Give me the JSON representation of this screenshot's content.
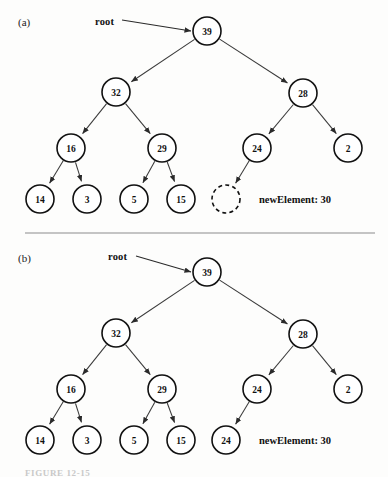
{
  "figure": {
    "caption": "FIGURE 12-15",
    "divider_y": 233
  },
  "panels": [
    {
      "id": "a",
      "label": "(a)",
      "label_pos": {
        "x": 18,
        "y": 16
      },
      "root_pointer": {
        "label": "root",
        "label_pos": {
          "x": 95,
          "y": 16
        },
        "line": {
          "x1": 122,
          "y1": 20,
          "x2": 191,
          "y2": 31
        }
      },
      "new_element": {
        "label": "newElement: 30",
        "pos": {
          "x": 259,
          "y": 194
        }
      },
      "nodes": [
        {
          "name": "node-39",
          "value": "39",
          "cx": 207,
          "cy": 31,
          "r": 14,
          "style": "solid"
        },
        {
          "name": "node-32",
          "value": "32",
          "cx": 116,
          "cy": 92,
          "r": 14,
          "style": "solid"
        },
        {
          "name": "node-28",
          "value": "28",
          "cx": 303,
          "cy": 93,
          "r": 14,
          "style": "solid"
        },
        {
          "name": "node-16",
          "value": "16",
          "cx": 71,
          "cy": 148,
          "r": 14,
          "style": "solid"
        },
        {
          "name": "node-29",
          "value": "29",
          "cx": 162,
          "cy": 148,
          "r": 14,
          "style": "solid"
        },
        {
          "name": "node-24",
          "value": "24",
          "cx": 257,
          "cy": 148,
          "r": 14,
          "style": "solid"
        },
        {
          "name": "node-2",
          "value": "2",
          "cx": 348,
          "cy": 148,
          "r": 14,
          "style": "solid"
        },
        {
          "name": "node-14",
          "value": "14",
          "cx": 40,
          "cy": 199,
          "r": 14,
          "style": "solid"
        },
        {
          "name": "node-3",
          "value": "3",
          "cx": 87,
          "cy": 199,
          "r": 14,
          "style": "solid"
        },
        {
          "name": "node-5",
          "value": "5",
          "cx": 134,
          "cy": 199,
          "r": 14,
          "style": "solid"
        },
        {
          "name": "node-15",
          "value": "15",
          "cx": 181,
          "cy": 199,
          "r": 14,
          "style": "solid"
        },
        {
          "name": "node-empty",
          "value": "",
          "cx": 226,
          "cy": 199,
          "r": 14,
          "style": "dashed"
        }
      ],
      "edges": [
        {
          "from": "node-39",
          "to": "node-32"
        },
        {
          "from": "node-39",
          "to": "node-28"
        },
        {
          "from": "node-32",
          "to": "node-16"
        },
        {
          "from": "node-32",
          "to": "node-29"
        },
        {
          "from": "node-28",
          "to": "node-24"
        },
        {
          "from": "node-28",
          "to": "node-2"
        },
        {
          "from": "node-16",
          "to": "node-14"
        },
        {
          "from": "node-16",
          "to": "node-3"
        },
        {
          "from": "node-29",
          "to": "node-5"
        },
        {
          "from": "node-29",
          "to": "node-15"
        },
        {
          "from": "node-24",
          "to": "node-empty"
        }
      ]
    },
    {
      "id": "b",
      "label": "(b)",
      "label_pos": {
        "x": 18,
        "y": 252
      },
      "root_pointer": {
        "label": "root",
        "label_pos": {
          "x": 108,
          "y": 251
        },
        "line": {
          "x1": 136,
          "y1": 256,
          "x2": 191,
          "y2": 272
        }
      },
      "new_element": {
        "label": "newElement: 30",
        "pos": {
          "x": 259,
          "y": 435
        }
      },
      "nodes": [
        {
          "name": "node-39",
          "value": "39",
          "cx": 207,
          "cy": 272,
          "r": 14,
          "style": "solid"
        },
        {
          "name": "node-32",
          "value": "32",
          "cx": 116,
          "cy": 333,
          "r": 14,
          "style": "solid"
        },
        {
          "name": "node-28",
          "value": "28",
          "cx": 303,
          "cy": 334,
          "r": 14,
          "style": "solid"
        },
        {
          "name": "node-16",
          "value": "16",
          "cx": 71,
          "cy": 389,
          "r": 14,
          "style": "solid"
        },
        {
          "name": "node-29",
          "value": "29",
          "cx": 162,
          "cy": 389,
          "r": 14,
          "style": "solid"
        },
        {
          "name": "node-24",
          "value": "24",
          "cx": 257,
          "cy": 389,
          "r": 14,
          "style": "solid"
        },
        {
          "name": "node-2",
          "value": "2",
          "cx": 348,
          "cy": 389,
          "r": 14,
          "style": "solid"
        },
        {
          "name": "node-14",
          "value": "14",
          "cx": 40,
          "cy": 440,
          "r": 14,
          "style": "solid"
        },
        {
          "name": "node-3",
          "value": "3",
          "cx": 87,
          "cy": 440,
          "r": 14,
          "style": "solid"
        },
        {
          "name": "node-5",
          "value": "5",
          "cx": 134,
          "cy": 440,
          "r": 14,
          "style": "solid"
        },
        {
          "name": "node-15",
          "value": "15",
          "cx": 181,
          "cy": 440,
          "r": 14,
          "style": "solid"
        },
        {
          "name": "node-24b",
          "value": "24",
          "cx": 226,
          "cy": 440,
          "r": 14,
          "style": "solid"
        }
      ],
      "edges": [
        {
          "from": "node-39",
          "to": "node-32"
        },
        {
          "from": "node-39",
          "to": "node-28"
        },
        {
          "from": "node-32",
          "to": "node-16"
        },
        {
          "from": "node-32",
          "to": "node-29"
        },
        {
          "from": "node-28",
          "to": "node-24"
        },
        {
          "from": "node-28",
          "to": "node-2"
        },
        {
          "from": "node-16",
          "to": "node-14"
        },
        {
          "from": "node-16",
          "to": "node-3"
        },
        {
          "from": "node-29",
          "to": "node-5"
        },
        {
          "from": "node-29",
          "to": "node-15"
        },
        {
          "from": "node-24",
          "to": "node-24b"
        }
      ]
    }
  ],
  "colors": {
    "ink": "#111111",
    "edge": "#3a3a3a",
    "divider": "#8b8b8b",
    "background": "#fdfdfc",
    "caption": "#c9c9c9"
  }
}
